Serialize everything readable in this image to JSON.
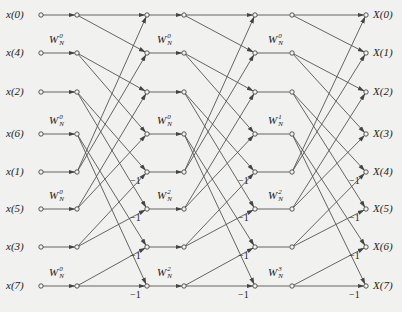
{
  "inputs": [
    "x(0)",
    "x(4)",
    "x(2)",
    "x(6)",
    "x(1)",
    "x(5)",
    "x(3)",
    "x(7)"
  ],
  "outputs": [
    "X(0)",
    "X(1)",
    "X(2)",
    "X(3)",
    "X(4)",
    "X(5)",
    "X(6)",
    "X(7)"
  ],
  "twiddle_base": "W",
  "twiddle_sub": "N",
  "stage1_twiddles": [
    {
      "row": 1,
      "exp": "0"
    },
    {
      "row": 3,
      "exp": "0"
    },
    {
      "row": 5,
      "exp": "0"
    },
    {
      "row": 7,
      "exp": "0"
    }
  ],
  "stage2_twiddles": [
    {
      "row": 1,
      "exp": "0"
    },
    {
      "row": 3,
      "exp": "0"
    },
    {
      "row": 5,
      "exp": "2"
    },
    {
      "row": 7,
      "exp": "2"
    }
  ],
  "stage3_twiddles": [
    {
      "row": 1,
      "exp": "0"
    },
    {
      "row": 3,
      "exp": "1"
    },
    {
      "row": 5,
      "exp": "2"
    },
    {
      "row": 7,
      "exp": "3"
    }
  ],
  "minus_one": "−1",
  "line_color": "#555555",
  "node_color": "#444444",
  "background": "#f1f1ef"
}
